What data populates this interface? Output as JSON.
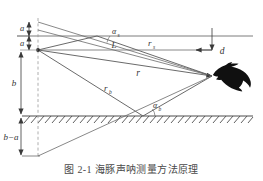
{
  "figure": {
    "caption": "图 2-1  海豚声呐测量方法原理",
    "background_color": "#ffffff",
    "line_color": "#4f4f4f",
    "dashed_color": "#8a8a8a"
  },
  "labels": {
    "a_top": "a",
    "a_lower": "a",
    "b": "b",
    "b_minus_a": "b−a",
    "d": "d",
    "L": "L",
    "r": "r",
    "r_s": "r",
    "r_s_sub": "s",
    "r_b": "r",
    "r_b_sub": "b",
    "alpha_s": "α",
    "alpha_s_sub": "s",
    "alpha_b": "α",
    "alpha_b_sub": "b"
  },
  "objects": {
    "dolphin": "dolphin-silhouette",
    "surface": "sea-surface-line",
    "seabed": "seabed-line",
    "hatching": "seabed-hatching"
  },
  "geometry": {
    "source_x": 38,
    "source_y": 50,
    "image_source_x": 38,
    "image_source_y": 30,
    "target_x": 212,
    "target_y": 76,
    "surface_y": 36,
    "seabed_y": 116,
    "virtual_bottom_y": 156,
    "surface_reflect_x": 97,
    "surface_reflect_y": 36,
    "bottom_reflect_x": 143,
    "bottom_reflect_y": 116
  }
}
